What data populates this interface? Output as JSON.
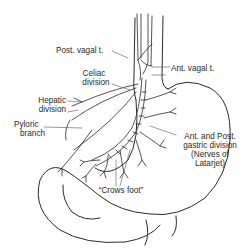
{
  "figure": {
    "labels": {
      "post_vagal": "Post. vagal t.",
      "ant_vagal": "Ant. vagal t.",
      "celiac_1": "Celiac",
      "celiac_2": "division",
      "hepatic_1": "Hepatic",
      "hepatic_2": "division",
      "pyloric_1": "Pyloric",
      "pyloric_2": "branch",
      "gastric_1": "Ant. and Post.",
      "gastric_2": "gastric division",
      "gastric_3": "(Nerves of",
      "gastric_4": "Latarjet)",
      "crows_foot": "“Crows foot”"
    },
    "colors": {
      "line": "#2a2a2a",
      "background": "#ffffff"
    }
  }
}
